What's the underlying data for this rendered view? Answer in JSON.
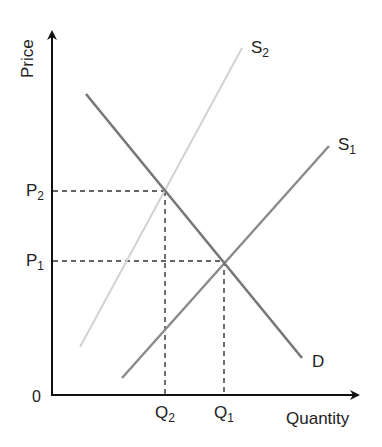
{
  "diagram": {
    "axes": {
      "y_label": "Price",
      "x_label": "Quantity",
      "origin_label": "0"
    },
    "curves": [
      {
        "id": "D",
        "label": "D",
        "color": "#777777"
      },
      {
        "id": "S1",
        "label_main": "S",
        "label_sub": "1",
        "color": "#8a8a8a"
      },
      {
        "id": "S2",
        "label_main": "S",
        "label_sub": "2",
        "color": "#cfcfcf"
      }
    ],
    "price_levels": [
      {
        "main": "P",
        "sub": "2"
      },
      {
        "main": "P",
        "sub": "1"
      }
    ],
    "quantity_levels": [
      {
        "main": "Q",
        "sub": "2"
      },
      {
        "main": "Q",
        "sub": "1"
      }
    ]
  }
}
